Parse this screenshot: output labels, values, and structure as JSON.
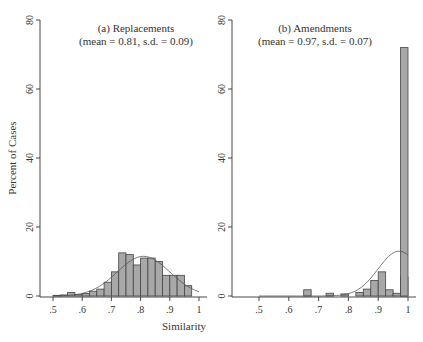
{
  "chart_data": [
    {
      "type": "bar",
      "panel": "a",
      "title": "(a) Replacements",
      "subtitle": "(mean = 0.81, s.d. = 0.09)",
      "xlabel": "Similarity",
      "ylabel": "Percent of Cases",
      "xlim": [
        0.5,
        1.0
      ],
      "ylim": [
        0,
        80
      ],
      "xticks": [
        ".5",
        ".6",
        ".7",
        ".8",
        ".9",
        "1"
      ],
      "yticks": [
        "0",
        "20",
        "40",
        "60",
        "80"
      ],
      "bin_width": 0.025,
      "bins": [
        0.5,
        0.525,
        0.55,
        0.575,
        0.6,
        0.625,
        0.65,
        0.675,
        0.7,
        0.725,
        0.75,
        0.775,
        0.8,
        0.825,
        0.85,
        0.875,
        0.9,
        0.925,
        0.95,
        0.975
      ],
      "values": [
        0.2,
        0.3,
        1.0,
        0.4,
        0.7,
        1.4,
        2.0,
        4.0,
        7.0,
        12.5,
        12.0,
        9.0,
        11.0,
        11.0,
        10.0,
        6.0,
        6.0,
        6.0,
        3.0,
        0
      ],
      "density_curve": {
        "type": "normal",
        "mean": 0.81,
        "sd": 0.09
      },
      "grid": false,
      "legend": "none"
    },
    {
      "type": "bar",
      "panel": "b",
      "title": "(b) Amendments",
      "subtitle": "(mean = 0.97, s.d. = 0.07)",
      "xlabel": "Similarity",
      "ylabel": "Percent of Cases",
      "xlim": [
        0.5,
        1.0
      ],
      "ylim": [
        0,
        80
      ],
      "xticks": [
        ".5",
        ".6",
        ".7",
        ".8",
        ".9",
        "1"
      ],
      "yticks": [
        "0",
        "20",
        "40",
        "60",
        "80"
      ],
      "bin_width": 0.025,
      "bins": [
        0.65,
        0.725,
        0.775,
        0.825,
        0.85,
        0.875,
        0.9,
        0.925,
        0.95,
        0.975
      ],
      "values": [
        1.8,
        0.8,
        0.6,
        1.0,
        2.0,
        4.5,
        7.0,
        1.8,
        0.8,
        5.5,
        72.0
      ],
      "bin_starts": [
        0.65,
        0.725,
        0.775,
        0.825,
        0.85,
        0.875,
        0.9,
        0.925,
        0.95,
        0.975,
        0.99
      ],
      "density_curve": {
        "type": "normal",
        "mean": 0.97,
        "sd": 0.07
      },
      "grid": false,
      "legend": "none"
    }
  ],
  "labels": {
    "panel_a_title": "(a) Replacements",
    "panel_a_stats": "(mean = 0.81, s.d. = 0.09)",
    "panel_b_title": "(b) Amendments",
    "panel_b_stats": "(mean = 0.97, s.d. = 0.07)",
    "xlabel": "Similarity",
    "ylabel": "Percent of Cases"
  }
}
